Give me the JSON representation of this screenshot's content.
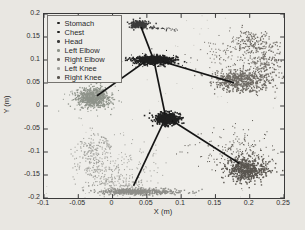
{
  "chart_data": {
    "type": "scatter",
    "title": "",
    "xlabel": "X (m)",
    "ylabel": "Y (m)",
    "xlim": [
      -0.1,
      0.25
    ],
    "ylim": [
      -0.2,
      0.2
    ],
    "grid": false,
    "legend_position": "top-left",
    "x_ticks": [
      -0.1,
      -0.05,
      0,
      0.05,
      0.1,
      0.15,
      0.2,
      0.25
    ],
    "x_tick_labels": [
      "-0.1",
      "-0.05",
      "0",
      "0.05",
      "0.1",
      "0.15",
      "0.2",
      "0.25"
    ],
    "y_ticks": [
      0.2,
      0.15,
      0.1,
      0.05,
      0,
      -0.05,
      -0.1,
      -0.15,
      -0.2
    ],
    "y_tick_labels": [
      "0.2",
      "0.15",
      "0.1",
      "0.05",
      "0",
      "-0.05",
      "-0.1",
      "-0.15",
      "-0.2"
    ],
    "axis_color": "#3a3a3a",
    "series": [
      {
        "name": "Stomach",
        "color": "#202020",
        "approx_center": [
          0.08,
          -0.028
        ],
        "clusters": [
          {
            "kind": "gauss",
            "c": [
              0.08,
              -0.028
            ],
            "s": [
              0.0085,
              0.006
            ],
            "n": 380,
            "size": 1.6
          }
        ]
      },
      {
        "name": "Chest",
        "color": "#202020",
        "approx_center": [
          0.06,
          0.1
        ],
        "clusters": [
          {
            "kind": "gauss",
            "c": [
              0.06,
              0.1
            ],
            "s": [
              0.014,
              0.0042
            ],
            "n": 480,
            "size": 1.6
          },
          {
            "kind": "gauss",
            "c": [
              0.06,
              0.1
            ],
            "s": [
              0.022,
              0.008
            ],
            "n": 70,
            "size": 1.0
          }
        ]
      },
      {
        "name": "Head",
        "color": "#3b3b3b",
        "approx_center": [
          0.04,
          0.177
        ],
        "clusters": [
          {
            "kind": "gauss",
            "c": [
              0.04,
              0.177
            ],
            "s": [
              0.0065,
              0.0042
            ],
            "n": 240,
            "size": 1.5
          },
          {
            "kind": "seg",
            "p0": [
              0.054,
              0.172
            ],
            "p1": [
              0.094,
              0.165
            ],
            "j": 0.0018,
            "n": 40,
            "size": 1.0
          }
        ]
      },
      {
        "name": "Left Elbow",
        "color": "#8e938a",
        "approx_center": [
          -0.028,
          0.018
        ],
        "clusters": [
          {
            "kind": "gauss",
            "c": [
              -0.028,
              0.018
            ],
            "s": [
              0.0125,
              0.0105
            ],
            "n": 620,
            "size": 1.3
          },
          {
            "kind": "gauss",
            "c": [
              -0.028,
              0.018
            ],
            "s": [
              0.02,
              0.017
            ],
            "n": 90,
            "size": 1.0
          }
        ]
      },
      {
        "name": "Right Elbow",
        "color": "#6f6b65",
        "approx_center": [
          0.185,
          0.065
        ],
        "clusters": [
          {
            "kind": "arc",
            "c": [
              0.175,
              0.095
            ],
            "r": 0.055,
            "a0": 80,
            "a1": -70,
            "j": 0.013,
            "n": 430,
            "size": 1.2
          },
          {
            "kind": "gauss",
            "c": [
              0.185,
              0.055
            ],
            "s": [
              0.018,
              0.012
            ],
            "n": 520,
            "size": 1.3
          },
          {
            "kind": "gauss",
            "c": [
              0.17,
              0.12
            ],
            "s": [
              0.022,
              0.02
            ],
            "n": 110,
            "size": 1.0
          }
        ]
      },
      {
        "name": "Left Knee",
        "color": "#a0a09b",
        "approx_center": [
          0.03,
          -0.15
        ],
        "clusters": [
          {
            "kind": "arc",
            "c": [
              0.03,
              -0.118
            ],
            "r": 0.063,
            "a0": 130,
            "a1": 285,
            "j": 0.014,
            "n": 430,
            "size": 1.1
          },
          {
            "kind": "gauss",
            "c": [
              0.02,
              -0.128
            ],
            "s": [
              0.03,
              0.028
            ],
            "n": 130,
            "size": 1.0
          },
          {
            "kind": "gauss",
            "c": [
              0.04,
              -0.186
            ],
            "s": [
              0.029,
              0.0035
            ],
            "n": 470,
            "size": 1.4,
            "color": "#8e8e89"
          }
        ]
      },
      {
        "name": "Right Knee",
        "color": "#5a5650",
        "approx_center": [
          0.195,
          -0.135
        ],
        "clusters": [
          {
            "kind": "gauss",
            "c": [
              0.195,
              -0.138
            ],
            "s": [
              0.016,
              0.013
            ],
            "n": 560,
            "size": 1.4
          },
          {
            "kind": "gauss",
            "c": [
              0.176,
              -0.102
            ],
            "s": [
              0.028,
              0.024
            ],
            "n": 210,
            "size": 1.0
          }
        ]
      }
    ],
    "skeleton_lines": {
      "color": "#141414",
      "width": 1.7,
      "segments": [
        {
          "from": "Head",
          "to": "Chest",
          "p": [
            [
              0.042,
              0.17
            ],
            [
              0.059,
              0.104
            ]
          ]
        },
        {
          "from": "Chest",
          "to": "Left Elbow",
          "p": [
            [
              0.047,
              0.096
            ],
            [
              -0.022,
              0.023
            ]
          ]
        },
        {
          "from": "Chest",
          "to": "Right Elbow",
          "p": [
            [
              0.074,
              0.096
            ],
            [
              0.176,
              0.051
            ]
          ]
        },
        {
          "from": "Chest",
          "to": "Stomach",
          "p": [
            [
              0.061,
              0.094
            ],
            [
              0.077,
              -0.021
            ]
          ]
        },
        {
          "from": "Stomach",
          "to": "Left Knee",
          "p": [
            [
              0.075,
              -0.033
            ],
            [
              0.031,
              -0.172
            ]
          ]
        },
        {
          "from": "Stomach",
          "to": "Right Knee",
          "p": [
            [
              0.086,
              -0.031
            ],
            [
              0.184,
              -0.124
            ]
          ]
        }
      ]
    },
    "speckle": {
      "n": 70,
      "color": "#bab8b2",
      "size": 0.8
    }
  }
}
